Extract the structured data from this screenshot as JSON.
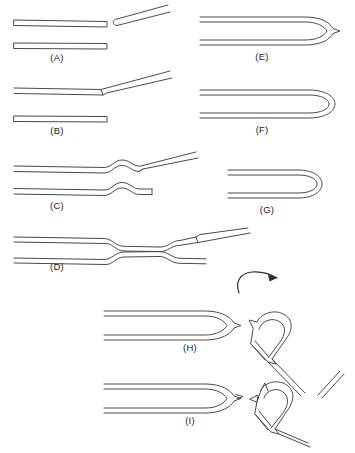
{
  "figure": {
    "background_color": "#ffffff",
    "line_color": "#4a4a4a",
    "label_color": "#1c1c1c"
  },
  "panels": [
    {
      "id": "A",
      "label": "(A)",
      "label_x": 57,
      "label_y": 61,
      "description": "Straight tube with separated angled tip above a straight tube"
    },
    {
      "id": "B",
      "label": "(B)",
      "label_x": 57,
      "label_y": 134,
      "description": "Straight tube joined to an upward angled tip above a straight tube"
    },
    {
      "id": "C",
      "label": "(C)",
      "label_x": 57,
      "label_y": 209,
      "description": "Tube with S-shaped kink and angled tip above a kinked tube"
    },
    {
      "id": "D",
      "label": "(D)",
      "label_x": 57,
      "label_y": 270,
      "description": "Wide tube tapering to a narrow neck then splitting to an angled tip"
    },
    {
      "id": "E",
      "label": "(E)",
      "label_x": 262,
      "label_y": 60,
      "description": "Long hairpin U-turn with pointed tip"
    },
    {
      "id": "F",
      "label": "(F)",
      "label_x": 262,
      "label_y": 133,
      "description": "Long hairpin U-turn with rounded closed end"
    },
    {
      "id": "G",
      "label": "(G)",
      "label_x": 267,
      "label_y": 213,
      "description": "Short hairpin U-turn with rounded closed end"
    },
    {
      "id": "H",
      "label": "(H)",
      "label_x": 190,
      "label_y": 351,
      "description": "Hairpin with pointed tip beside a rotated hairpin and curved rotation arrow"
    },
    {
      "id": "I",
      "label": "(I)",
      "label_x": 190,
      "label_y": 424,
      "description": "Hairpin with barbed tip beside a rotated barbed hairpin"
    }
  ],
  "annotations": [
    {
      "name": "rotation-arrow",
      "type": "curved-arrow",
      "direction": "clockwise-right",
      "x": 245,
      "y": 275
    }
  ]
}
